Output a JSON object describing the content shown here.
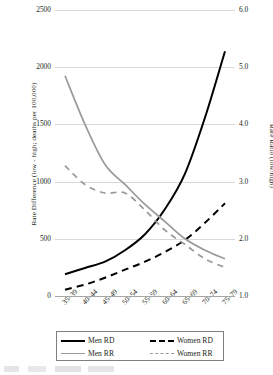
{
  "chart_data": {
    "type": "line",
    "title": "",
    "xlabel": "",
    "ylabel": "Rate Difference (low - high; deaths per 100,000)",
    "y2label": "Rate Ratio (low/high)",
    "categories": [
      "35–39",
      "40–44",
      "45–49",
      "50–54",
      "55–59",
      "60–64",
      "65–69",
      "70–74",
      "75–79"
    ],
    "ylim": [
      0,
      2500
    ],
    "yticks": [
      "0",
      "500",
      "1000",
      "1500",
      "2000",
      "2500"
    ],
    "ytick_values": [
      0,
      500,
      1000,
      1500,
      2000,
      2500
    ],
    "y2lim": [
      1.0,
      6.0
    ],
    "y2ticks": [
      "1.0",
      "2.0",
      "3.0",
      "4.0",
      "5.0",
      "6.0"
    ],
    "y2tick_values": [
      1.0,
      2.0,
      3.0,
      4.0,
      5.0,
      6.0
    ],
    "grid": true,
    "legend_position": "bottom",
    "series": [
      {
        "name": "Men RD",
        "axis": "left",
        "style": "solid",
        "color": "#000000",
        "values": [
          190,
          245,
          300,
          400,
          540,
          760,
          1070,
          1560,
          2140
        ]
      },
      {
        "name": "Women RD",
        "axis": "left",
        "style": "dashed",
        "color": "#000000",
        "values": [
          55,
          100,
          160,
          230,
          300,
          385,
          490,
          640,
          810
        ]
      },
      {
        "name": "Men RR",
        "axis": "right",
        "style": "solid",
        "color": "#9a9a9a",
        "values": [
          4.85,
          4.0,
          3.3,
          2.95,
          2.6,
          2.3,
          2.0,
          1.8,
          1.65
        ]
      },
      {
        "name": "Women RR",
        "axis": "right",
        "style": "dashed",
        "color": "#9a9a9a",
        "values": [
          3.28,
          2.95,
          2.8,
          2.8,
          2.5,
          2.15,
          1.9,
          1.65,
          1.5
        ]
      }
    ]
  },
  "legend": {
    "items": [
      {
        "label": "Men RD"
      },
      {
        "label": "Women RD"
      },
      {
        "label": "Men RR"
      },
      {
        "label": "Women RR"
      }
    ]
  }
}
